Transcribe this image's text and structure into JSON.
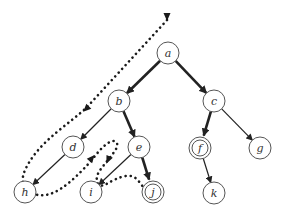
{
  "diagram": {
    "type": "search-tree-traversal",
    "colors": {
      "node_stroke": "#555555",
      "node_fill": "#ffffff",
      "edge": "#222222",
      "path": "#1a1a1a",
      "label": "#333333"
    },
    "nodes": [
      {
        "id": "a",
        "label": "a",
        "x": 168,
        "y": 53,
        "goal": false
      },
      {
        "id": "b",
        "label": "b",
        "x": 119,
        "y": 101,
        "goal": false
      },
      {
        "id": "c",
        "label": "c",
        "x": 214,
        "y": 101,
        "goal": false
      },
      {
        "id": "d",
        "label": "d",
        "x": 73,
        "y": 147,
        "goal": false
      },
      {
        "id": "e",
        "label": "e",
        "x": 139,
        "y": 147,
        "goal": false
      },
      {
        "id": "f",
        "label": "f",
        "x": 200,
        "y": 148,
        "goal": true
      },
      {
        "id": "g",
        "label": "g",
        "x": 260,
        "y": 148,
        "goal": false
      },
      {
        "id": "h",
        "label": "h",
        "x": 25,
        "y": 192,
        "goal": false
      },
      {
        "id": "i",
        "label": "i",
        "x": 91,
        "y": 192,
        "goal": false
      },
      {
        "id": "j",
        "label": "j",
        "x": 153,
        "y": 192,
        "goal": true
      },
      {
        "id": "k",
        "label": "k",
        "x": 214,
        "y": 193,
        "goal": false
      }
    ],
    "edges": [
      {
        "from": "a",
        "to": "b",
        "bold": true
      },
      {
        "from": "a",
        "to": "c",
        "bold": true
      },
      {
        "from": "b",
        "to": "d",
        "bold": false
      },
      {
        "from": "b",
        "to": "e",
        "bold": true
      },
      {
        "from": "d",
        "to": "h",
        "bold": false
      },
      {
        "from": "e",
        "to": "i",
        "bold": false
      },
      {
        "from": "e",
        "to": "j",
        "bold": true
      },
      {
        "from": "c",
        "to": "f",
        "bold": true
      },
      {
        "from": "c",
        "to": "g",
        "bold": false
      },
      {
        "from": "f",
        "to": "k",
        "bold": false
      }
    ],
    "traversal_path": {
      "style": "dotted",
      "d": "M167,20 L88,106 C70,124 40,140 26,168 C20,180 22,188 34,194 C52,200 70,184 92,160 C102,146 112,138 116,142 C120,146 114,152 108,160 C100,170 94,176 98,184 C102,190 112,178 126,176 C138,174 140,186 145,188",
      "arrowheads": [
        {
          "x": 167,
          "y": 17,
          "angle": 90
        },
        {
          "x": 86,
          "y": 109,
          "angle": 135
        },
        {
          "x": 92,
          "y": 158,
          "angle": -50
        },
        {
          "x": 108,
          "y": 160,
          "angle": 115
        }
      ]
    }
  }
}
